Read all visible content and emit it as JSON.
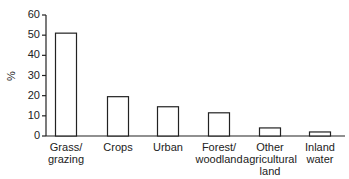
{
  "chart_data": {
    "type": "bar",
    "title": "",
    "xlabel": "",
    "ylabel": "%",
    "ylim": [
      0,
      60
    ],
    "yticks": [
      0,
      10,
      20,
      30,
      40,
      50,
      60
    ],
    "grid": false,
    "categories": [
      "Grass/ grazing",
      "Crops",
      "Urban",
      "Forest/ woodland",
      "Other agricultural land",
      "Inland water"
    ],
    "category_lines": [
      [
        "Grass/",
        "grazing"
      ],
      [
        "Crops"
      ],
      [
        "Urban"
      ],
      [
        "Forest/",
        "woodland"
      ],
      [
        "Other",
        "agricultural",
        "land"
      ],
      [
        "Inland",
        "water"
      ]
    ],
    "values": [
      51,
      19.5,
      14.5,
      11.5,
      4,
      2
    ],
    "bar_color": "#ffffff",
    "bar_edge": "#222222"
  }
}
